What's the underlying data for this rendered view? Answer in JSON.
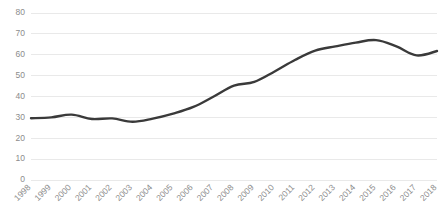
{
  "chart_data": {
    "type": "line",
    "title": "",
    "subtitle": "",
    "xlabel": "",
    "ylabel": "",
    "categories": [
      "1998",
      "1999",
      "2000",
      "2001",
      "2002",
      "2003",
      "2004",
      "2005",
      "2006",
      "2007",
      "2008",
      "2009",
      "2010",
      "2011",
      "2012",
      "2013",
      "2014",
      "2015",
      "2016",
      "2017",
      "2018"
    ],
    "values": [
      29.6,
      30.0,
      31.3,
      29.2,
      29.5,
      27.9,
      29.4,
      31.8,
      35.0,
      40.0,
      45.2,
      47.0,
      52.0,
      57.5,
      62.0,
      64.0,
      65.8,
      67.0,
      64.0,
      59.7,
      61.8
    ],
    "series": [
      {
        "name": "series-1",
        "color": "#3a3a3a",
        "values": [
          29.6,
          30.0,
          31.3,
          29.2,
          29.5,
          27.9,
          29.4,
          31.8,
          35.0,
          40.0,
          45.2,
          47.0,
          52.0,
          57.5,
          62.0,
          64.0,
          65.8,
          67.0,
          64.0,
          59.7,
          61.8
        ]
      }
    ],
    "ylim": [
      0,
      80
    ],
    "yticks": [
      0,
      10,
      20,
      30,
      40,
      50,
      60,
      70,
      80
    ],
    "ytick_labels": [
      "0",
      "10",
      "20",
      "30",
      "40",
      "50",
      "60",
      "70",
      "80"
    ],
    "grid": "horizontal",
    "legend": "none",
    "xtick_rotation": 45,
    "colors": {
      "line": "#3a3a3a",
      "gridline": "#e4e4e4",
      "tick_label": "#8c8c8c",
      "background": "#ffffff"
    }
  },
  "plot": {
    "left": 31,
    "right": 437,
    "top": 13,
    "bottom": 180
  }
}
